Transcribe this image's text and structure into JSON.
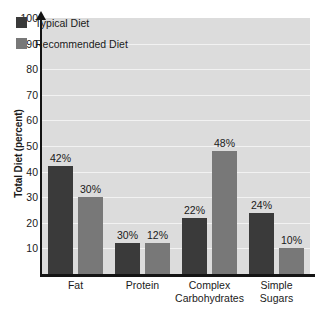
{
  "chart_data": {
    "type": "bar",
    "title": "",
    "xlabel": "",
    "ylabel": "Total Diet (percent)",
    "ylim": [
      0,
      100
    ],
    "grid": true,
    "legend_position": "top-left",
    "categories": [
      "Fat",
      "Protein",
      "Complex Carbohydrates",
      "Simple Sugars"
    ],
    "category_lines": [
      [
        "Fat"
      ],
      [
        "Protein"
      ],
      [
        "Complex",
        "Carbohydrates"
      ],
      [
        "Simple",
        "Sugars"
      ]
    ],
    "y_ticks": [
      10,
      20,
      30,
      40,
      50,
      60,
      70,
      80,
      90,
      100
    ],
    "series": [
      {
        "name": "Typical Diet",
        "color": "#3a3a3a",
        "values": [
          42,
          12,
          22,
          24
        ],
        "value_labels": [
          "42%",
          "30%",
          "22%",
          "24%"
        ]
      },
      {
        "name": "Recommended Diet",
        "color": "#787878",
        "values": [
          30,
          12,
          48,
          10
        ],
        "value_labels": [
          "30%",
          "12%",
          "48%",
          "10%"
        ]
      }
    ],
    "bars": [
      {
        "category": "Fat",
        "series": "Typical Diet",
        "value": 42,
        "label": "42%"
      },
      {
        "category": "Fat",
        "series": "Recommended Diet",
        "value": 30,
        "label": "30%"
      },
      {
        "category": "Protein",
        "series": "Typical Diet",
        "value": 12,
        "label": "12%"
      },
      {
        "category": "Protein",
        "series": "Recommended Diet",
        "value": 12,
        "label": "12%"
      },
      {
        "category": "Complex Carbohydrates",
        "series": "Typical Diet",
        "value": 22,
        "label": "22%"
      },
      {
        "category": "Complex Carbohydrates",
        "series": "Recommended Diet",
        "value": 48,
        "label": "48%"
      },
      {
        "category": "Simple Sugars",
        "series": "Typical Diet",
        "value": 24,
        "label": "24%"
      },
      {
        "category": "Simple Sugars",
        "series": "Recommended Diet",
        "value": 10,
        "label": "10%"
      }
    ],
    "colors": {
      "plot_background": "#dcdcdc",
      "page_background": "#ffffff",
      "gridline": "#f2f2f2",
      "axis": "#141414",
      "text": "#1a1a1a"
    }
  },
  "legend": {
    "items": [
      {
        "label": "Typical Diet",
        "color": "#3a3a3a"
      },
      {
        "label": "Recommended Diet",
        "color": "#787878"
      }
    ]
  },
  "y_axis": {
    "title": "Total Diet (percent)",
    "ticks": [
      "100",
      "90",
      "80",
      "70",
      "60",
      "50",
      "40",
      "30",
      "20",
      "10"
    ]
  }
}
